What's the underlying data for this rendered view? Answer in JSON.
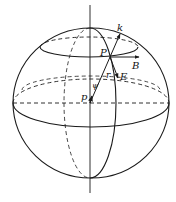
{
  "diagram": {
    "labels": {
      "k": "k",
      "P": "P",
      "B": "B",
      "E": "E",
      "r": "r",
      "psi": "ψ",
      "p": "p"
    },
    "colors": {
      "stroke": "#1a1a1a",
      "background": "#ffffff"
    }
  }
}
